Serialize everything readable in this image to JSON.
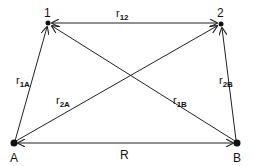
{
  "diagram": {
    "points": {
      "p1": {
        "label": "1"
      },
      "p2": {
        "label": "2"
      },
      "A": {
        "label": "A"
      },
      "B": {
        "label": "B"
      }
    },
    "edges": {
      "r12": {
        "main": "r",
        "sub": "12",
        "from": "1",
        "to": "2",
        "arrows": "both"
      },
      "r1A": {
        "main": "r",
        "sub": "1A",
        "from": "A",
        "to": "1",
        "arrows": "end"
      },
      "r2A": {
        "main": "r",
        "sub": "2A",
        "from": "A",
        "to": "2",
        "arrows": "end"
      },
      "r1B": {
        "main": "r",
        "sub": "1B",
        "from": "B",
        "to": "1",
        "arrows": "end"
      },
      "r2B": {
        "main": "r",
        "sub": "2B",
        "from": "B",
        "to": "2",
        "arrows": "end"
      },
      "R": {
        "main": "R",
        "from": "A",
        "to": "B",
        "arrows": "both"
      }
    },
    "colors": {
      "line": "#222222",
      "background": "#ffffff"
    }
  }
}
